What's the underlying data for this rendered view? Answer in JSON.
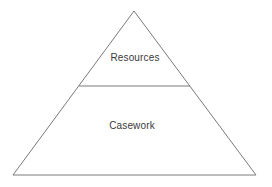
{
  "diagram": {
    "type": "pyramid",
    "title": "",
    "background_color": "#ffffff",
    "stroke_color": "#7a7a7a",
    "text_color": "#3a3a3a",
    "apex": {
      "x": 134,
      "y": 11
    },
    "base_left": {
      "x": 13,
      "y": 175
    },
    "base_right": {
      "x": 256,
      "y": 175
    },
    "divider": {
      "y": 86,
      "x_start": 79,
      "x_end": 190
    },
    "tiers": [
      {
        "id": "tier-resources",
        "label": "Resources",
        "label_x": 135,
        "label_y": 57,
        "position": "top"
      },
      {
        "id": "tier-casework",
        "label": "Casework",
        "label_x": 132,
        "label_y": 125,
        "position": "bottom"
      }
    ]
  }
}
